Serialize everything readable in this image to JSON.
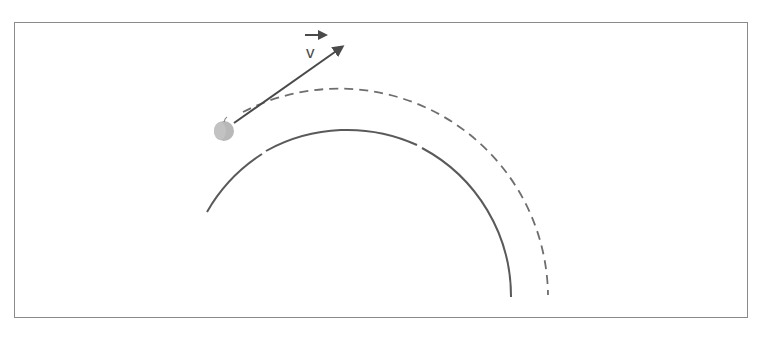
{
  "diagram": {
    "velocity_label": "v",
    "velocity_label_has_arrow": true,
    "elements": {
      "object": "apple",
      "velocity_vector": "arrow tangent from apple",
      "trajectory_path": "dashed arc",
      "circle_reference": "solid arc"
    },
    "colors": {
      "stroke": "#5a5a5a",
      "dashed": "#6e6e6e",
      "apple": "#b8b8b8",
      "border": "#8a8a8a"
    }
  }
}
